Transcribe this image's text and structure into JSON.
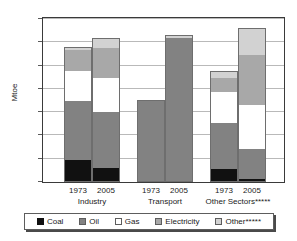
{
  "chart_data": {
    "type": "bar",
    "stacked": true,
    "title": "",
    "xlabel": "",
    "ylabel": "Mtoe",
    "ylim": [
      0,
      1400
    ],
    "yticks": [
      0,
      200,
      400,
      600,
      800,
      1000,
      1200,
      1400
    ],
    "grid": true,
    "legend_position": "bottom",
    "groups": [
      "Industry",
      "Transport",
      "Other Sectors*****"
    ],
    "categories": [
      "1973",
      "2005",
      "1973",
      "2005",
      "1973",
      "2005"
    ],
    "series": [
      {
        "name": "Coal",
        "color": "#111111",
        "values": [
          190,
          120,
          0,
          0,
          110,
          25
        ]
      },
      {
        "name": "Oil",
        "color": "#828282",
        "values": [
          510,
          480,
          695,
          1240,
          400,
          255
        ]
      },
      {
        "name": "Gas",
        "color": "#ffffff",
        "values": [
          255,
          290,
          0,
          0,
          260,
          380
        ]
      },
      {
        "name": "Electricity",
        "color": "#a8a8a8",
        "values": [
          175,
          265,
          0,
          0,
          125,
          430
        ]
      },
      {
        "name": "Other*****",
        "color": "#d2d2d2",
        "values": [
          30,
          85,
          10,
          25,
          60,
          235
        ]
      }
    ],
    "totals": [
      1160,
      1240,
      705,
      1265,
      955,
      1325
    ]
  },
  "axis": {
    "y_title": "Mtoe",
    "y_ticks": [
      "1400",
      "1200",
      "1000",
      "800",
      "600",
      "400",
      "200",
      "0"
    ]
  },
  "x_axis": {
    "years": [
      "1973",
      "2005",
      "1973",
      "2005",
      "1973",
      "2005"
    ],
    "groups": [
      "Industry",
      "Transport",
      "Other Sectors*****"
    ]
  },
  "legend": {
    "items": [
      {
        "label": "Coal"
      },
      {
        "label": "Oil"
      },
      {
        "label": "Gas"
      },
      {
        "label": "Electricity"
      },
      {
        "label": "Other*****"
      }
    ]
  }
}
